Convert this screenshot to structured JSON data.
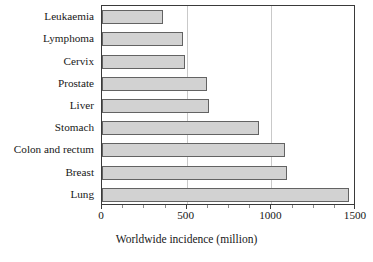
{
  "chart_data": {
    "type": "bar",
    "orientation": "horizontal",
    "title": "",
    "xlabel": "Worldwide incidence (million)",
    "ylabel": "",
    "categories": [
      "Leukaemia",
      "Lymphoma",
      "Cervix",
      "Prostate",
      "Liver",
      "Stomach",
      "Colon and rectum",
      "Breast",
      "Lung"
    ],
    "values": [
      360,
      480,
      490,
      620,
      630,
      930,
      1080,
      1095,
      1460
    ],
    "xlim": [
      0,
      1500
    ],
    "xticks": [
      0,
      500,
      1000,
      1500
    ],
    "xticklabels": [
      "0",
      "500",
      "1000",
      "1500"
    ],
    "minor_xticks": [
      125,
      250,
      375,
      625,
      750,
      875,
      1125,
      1250,
      1375
    ],
    "grid": "vertical-major",
    "legend": null,
    "bar_fill": "#d2d2d2",
    "bar_edge": "#636363",
    "gridline_color": "#c9c9c9",
    "frame_color": "#3a3a3a"
  }
}
